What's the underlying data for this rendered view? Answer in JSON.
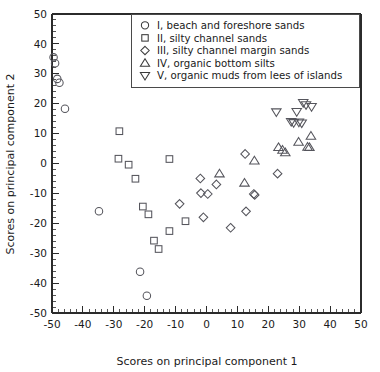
{
  "chart_data": {
    "type": "scatter",
    "title": "",
    "xlabel": "Scores on principal component 1",
    "ylabel": "Scores on principal component 2",
    "xlim": [
      -50,
      50
    ],
    "ylim": [
      -50,
      50
    ],
    "xticks": [
      -50,
      -40,
      -30,
      -20,
      -10,
      0,
      10,
      20,
      30,
      40,
      50
    ],
    "yticks": [
      -50,
      -40,
      -30,
      -20,
      -10,
      0,
      10,
      20,
      30,
      40,
      50
    ],
    "xtick_labels": [
      "-50",
      "-40",
      "-30",
      "-20",
      "-10",
      "0",
      "10",
      "20",
      "30",
      "40",
      "50"
    ],
    "ytick_labels": [
      "-50",
      "-40",
      "-30",
      "-20",
      "-10",
      "0",
      "10",
      "20",
      "30",
      "40",
      "50"
    ],
    "minor_tick_step": 2,
    "grid": false,
    "legend_position": "top-right",
    "series": [
      {
        "name": "I, beach and foreshore sands",
        "marker": "circle",
        "points": [
          [
            -49.5,
            35.5
          ],
          [
            -49.0,
            33.5
          ],
          [
            -48.3,
            28.3
          ],
          [
            -47.6,
            27.0
          ],
          [
            -45.8,
            18.3
          ],
          [
            -34.8,
            -16.0
          ],
          [
            -21.5,
            -36.2
          ],
          [
            -19.3,
            -44.2
          ]
        ]
      },
      {
        "name": "II, silty channel sands",
        "marker": "square",
        "points": [
          [
            -28.2,
            10.8
          ],
          [
            -28.5,
            1.6
          ],
          [
            -25.2,
            -0.4
          ],
          [
            -23.0,
            -5.1
          ],
          [
            -20.6,
            -14.4
          ],
          [
            -18.8,
            -17.0
          ],
          [
            -17.0,
            -25.8
          ],
          [
            -15.5,
            -28.6
          ],
          [
            -12.0,
            1.5
          ],
          [
            -12.0,
            -22.6
          ],
          [
            -6.8,
            -19.3
          ]
        ]
      },
      {
        "name": "III, silty channel margin sands",
        "marker": "diamond",
        "points": [
          [
            -8.7,
            -13.5
          ],
          [
            -2.0,
            -5.0
          ],
          [
            -1.8,
            -9.9
          ],
          [
            -1.0,
            -18.0
          ],
          [
            0.4,
            -10.2
          ],
          [
            3.2,
            -7.0
          ],
          [
            7.8,
            -21.5
          ],
          [
            12.5,
            3.2
          ],
          [
            12.8,
            -16.0
          ],
          [
            15.3,
            -10.2
          ],
          [
            15.6,
            -10.5
          ],
          [
            23.0,
            -3.4
          ]
        ]
      },
      {
        "name": "IV, organic bottom silts",
        "marker": "triangle-up",
        "points": [
          [
            4.2,
            -3.4
          ],
          [
            12.3,
            -6.5
          ],
          [
            15.5,
            0.9
          ],
          [
            23.3,
            5.4
          ],
          [
            24.6,
            4.5
          ],
          [
            25.5,
            3.7
          ],
          [
            29.8,
            7.2
          ],
          [
            32.7,
            5.5
          ],
          [
            33.3,
            5.4
          ],
          [
            33.8,
            9.2
          ]
        ]
      },
      {
        "name": "V, organic muds from lees of islands",
        "marker": "triangle-down",
        "points": [
          [
            22.6,
            17.2
          ],
          [
            27.4,
            14.0
          ],
          [
            28.2,
            13.6
          ],
          [
            29.2,
            17.3
          ],
          [
            29.9,
            13.8
          ],
          [
            30.8,
            13.5
          ],
          [
            31.3,
            20.3
          ],
          [
            32.2,
            19.6
          ],
          [
            34.0,
            19.0
          ]
        ]
      }
    ]
  },
  "legend": {
    "items": [
      {
        "marker": "circle",
        "label": "I, beach and foreshore sands"
      },
      {
        "marker": "square",
        "label": "II, silty channel sands"
      },
      {
        "marker": "diamond",
        "label": "III, silty channel margin sands"
      },
      {
        "marker": "triangle-up",
        "label": "IV, organic bottom silts"
      },
      {
        "marker": "triangle-down",
        "label": "V, organic muds from lees of islands"
      }
    ]
  },
  "colors": {
    "axis": "#2b2b2b",
    "marker": "#55555c",
    "legend_border": "#4a4a4a",
    "text": "#1a1a1a",
    "background": "#ffffff"
  }
}
